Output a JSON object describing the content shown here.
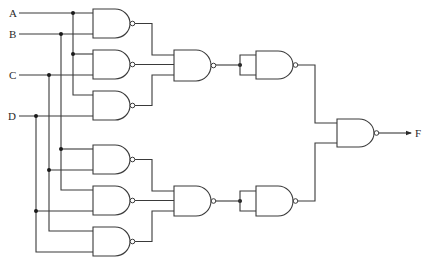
{
  "diagram": {
    "type": "logic-circuit",
    "gate_type": "NAND",
    "inputs": [
      {
        "name": "A",
        "label": "A",
        "y": 13
      },
      {
        "name": "B",
        "label": "B",
        "y": 34
      },
      {
        "name": "C",
        "label": "C",
        "y": 75
      },
      {
        "name": "D",
        "label": "D",
        "y": 116
      }
    ],
    "output": {
      "name": "F",
      "label": "F"
    },
    "gates": [
      {
        "id": "G1",
        "type": "NAND",
        "inputs": [
          "A",
          "B"
        ],
        "stage": 1
      },
      {
        "id": "G2",
        "type": "NAND",
        "inputs": [
          "A",
          "C"
        ],
        "stage": 1
      },
      {
        "id": "G3",
        "type": "NAND",
        "inputs": [
          "A",
          "D"
        ],
        "stage": 1
      },
      {
        "id": "G4",
        "type": "NAND",
        "inputs": [
          "B",
          "C"
        ],
        "stage": 1
      },
      {
        "id": "G5",
        "type": "NAND",
        "inputs": [
          "B",
          "D"
        ],
        "stage": 1
      },
      {
        "id": "G6",
        "type": "NAND",
        "inputs": [
          "C",
          "D"
        ],
        "stage": 1
      },
      {
        "id": "G7",
        "type": "NAND",
        "inputs": [
          "G1",
          "G2",
          "G3"
        ],
        "stage": 2
      },
      {
        "id": "G8",
        "type": "NAND",
        "inputs": [
          "G4",
          "G5",
          "G6"
        ],
        "stage": 2
      },
      {
        "id": "G9",
        "type": "NAND",
        "inputs": [
          "G7",
          "G7"
        ],
        "stage": 3
      },
      {
        "id": "G10",
        "type": "NAND",
        "inputs": [
          "G8",
          "G8"
        ],
        "stage": 3
      },
      {
        "id": "G11",
        "type": "NAND",
        "inputs": [
          "G9",
          "G10"
        ],
        "stage": 4
      }
    ]
  }
}
